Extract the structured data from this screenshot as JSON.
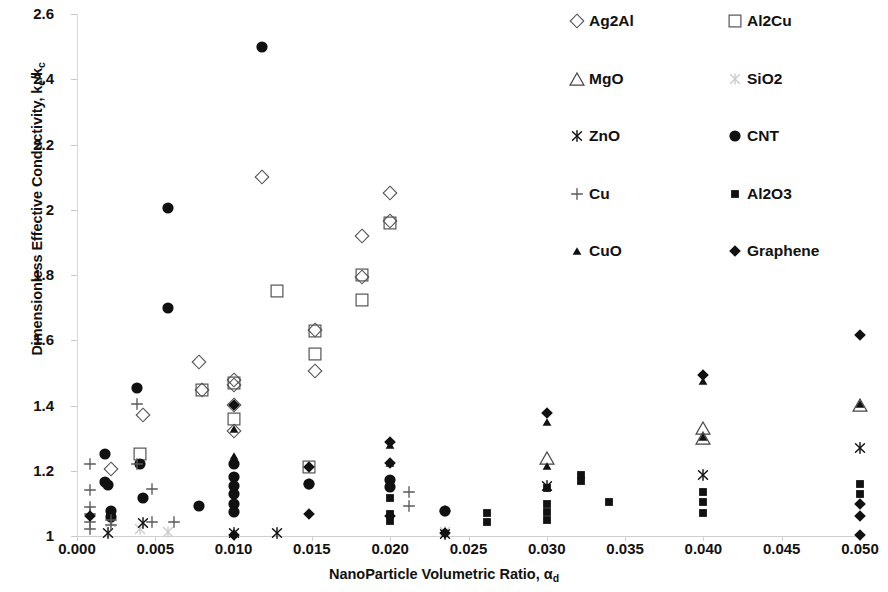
{
  "chart_data": {
    "type": "scatter",
    "title": "",
    "xlabel": "NanoParticle Volumetric Ratio, αd",
    "ylabel": "Dimensionless Effective Conductivity, ke/kc",
    "xlim": [
      0.0,
      0.05
    ],
    "ylim": [
      1.0,
      2.6
    ],
    "xticks": [
      "0.000",
      "0.005",
      "0.010",
      "0.015",
      "0.020",
      "0.025",
      "0.030",
      "0.035",
      "0.040",
      "0.045",
      "0.050"
    ],
    "xtick_values": [
      0.0,
      0.005,
      0.01,
      0.015,
      0.02,
      0.025,
      0.03,
      0.035,
      0.04,
      0.045,
      0.05
    ],
    "yticks": [
      "1",
      "1.2",
      "1.4",
      "1.6",
      "1.8",
      "2",
      "2.2",
      "2.4",
      "2.6"
    ],
    "ytick_values": [
      1,
      1.2,
      1.4,
      1.6,
      1.8,
      2,
      2.2,
      2.4,
      2.6
    ],
    "grid": false,
    "legend_position": "top-right",
    "marker_color": "#111111",
    "series": [
      {
        "name": "Ag2Al",
        "marker": "open-diamond",
        "points": [
          [
            0.0042,
            1.372
          ],
          [
            0.0078,
            1.532
          ],
          [
            0.008,
            1.448
          ],
          [
            0.01,
            1.478
          ],
          [
            0.01,
            1.462
          ],
          [
            0.01,
            1.402
          ],
          [
            0.01,
            1.322
          ],
          [
            0.0118,
            2.1
          ],
          [
            0.0152,
            1.632
          ],
          [
            0.0152,
            1.506
          ],
          [
            0.0182,
            1.92
          ],
          [
            0.0182,
            1.795
          ],
          [
            0.02,
            2.05
          ],
          [
            0.02,
            1.965
          ],
          [
            0.0022,
            1.205
          ]
        ]
      },
      {
        "name": "Al2Cu",
        "marker": "open-square",
        "points": [
          [
            0.004,
            1.25
          ],
          [
            0.008,
            1.448
          ],
          [
            0.01,
            1.47
          ],
          [
            0.01,
            1.36
          ],
          [
            0.0128,
            1.75
          ],
          [
            0.0152,
            1.628
          ],
          [
            0.0152,
            1.558
          ],
          [
            0.0182,
            1.8
          ],
          [
            0.0182,
            1.722
          ],
          [
            0.02,
            1.958
          ],
          [
            0.0148,
            1.212
          ]
        ]
      },
      {
        "name": "MgO",
        "marker": "open-triangle",
        "points": [
          [
            0.03,
            1.24
          ],
          [
            0.04,
            1.3
          ],
          [
            0.04,
            1.332
          ],
          [
            0.05,
            1.402
          ]
        ]
      },
      {
        "name": "SiO2",
        "marker": "light-x",
        "points": [
          [
            0.0022,
            1.042
          ],
          [
            0.004,
            1.022
          ],
          [
            0.0058,
            1.012
          ],
          [
            0.0235,
            1.012
          ]
        ]
      },
      {
        "name": "ZnO",
        "marker": "x-asterisk",
        "points": [
          [
            0.002,
            1.008
          ],
          [
            0.0042,
            1.04
          ],
          [
            0.01,
            1.008
          ],
          [
            0.0128,
            1.01
          ],
          [
            0.0235,
            1.005
          ],
          [
            0.03,
            1.152
          ],
          [
            0.04,
            1.188
          ],
          [
            0.05,
            1.27
          ]
        ]
      },
      {
        "name": "CNT",
        "marker": "filled-circle",
        "points": [
          [
            0.0018,
            1.25
          ],
          [
            0.0018,
            1.165
          ],
          [
            0.002,
            1.155
          ],
          [
            0.0022,
            1.078
          ],
          [
            0.0022,
            1.058
          ],
          [
            0.0038,
            1.455
          ],
          [
            0.004,
            1.222
          ],
          [
            0.0042,
            1.118
          ],
          [
            0.0058,
            2.005
          ],
          [
            0.0058,
            1.7
          ],
          [
            0.0078,
            1.092
          ],
          [
            0.01,
            1.222
          ],
          [
            0.01,
            1.182
          ],
          [
            0.01,
            1.152
          ],
          [
            0.01,
            1.128
          ],
          [
            0.01,
            1.098
          ],
          [
            0.01,
            1.075
          ],
          [
            0.0118,
            2.5
          ],
          [
            0.0148,
            1.158
          ],
          [
            0.02,
            1.172
          ],
          [
            0.02,
            1.15
          ],
          [
            0.0235,
            1.078
          ]
        ]
      },
      {
        "name": "Cu",
        "marker": "plus",
        "points": [
          [
            0.0008,
            1.222
          ],
          [
            0.0008,
            1.142
          ],
          [
            0.0008,
            1.088
          ],
          [
            0.0008,
            1.068
          ],
          [
            0.0008,
            1.042
          ],
          [
            0.0008,
            1.022
          ],
          [
            0.0022,
            1.05
          ],
          [
            0.0022,
            1.035
          ],
          [
            0.0038,
            1.405
          ],
          [
            0.0038,
            1.222
          ],
          [
            0.0048,
            1.145
          ],
          [
            0.0048,
            1.042
          ],
          [
            0.0062,
            1.042
          ],
          [
            0.0212,
            1.135
          ],
          [
            0.0212,
            1.092
          ]
        ]
      },
      {
        "name": "Al2O3",
        "marker": "filled-square",
        "points": [
          [
            0.02,
            1.155
          ],
          [
            0.02,
            1.115
          ],
          [
            0.02,
            1.068
          ],
          [
            0.02,
            1.045
          ],
          [
            0.0262,
            1.07
          ],
          [
            0.0262,
            1.042
          ],
          [
            0.03,
            1.148
          ],
          [
            0.03,
            1.098
          ],
          [
            0.03,
            1.075
          ],
          [
            0.03,
            1.048
          ],
          [
            0.0322,
            1.188
          ],
          [
            0.0322,
            1.168
          ],
          [
            0.034,
            1.105
          ],
          [
            0.04,
            1.135
          ],
          [
            0.04,
            1.105
          ],
          [
            0.04,
            1.072
          ],
          [
            0.05,
            1.158
          ],
          [
            0.05,
            1.13
          ]
        ]
      },
      {
        "name": "CuO",
        "marker": "small-filled-triangle",
        "points": [
          [
            0.01,
            1.245
          ],
          [
            0.01,
            1.328
          ],
          [
            0.02,
            1.278
          ],
          [
            0.02,
            1.225
          ],
          [
            0.03,
            1.215
          ],
          [
            0.03,
            1.348
          ],
          [
            0.04,
            1.302
          ],
          [
            0.04,
            1.475
          ],
          [
            0.05,
            1.405
          ]
        ]
      },
      {
        "name": "Graphene",
        "marker": "filled-diamond",
        "points": [
          [
            0.0008,
            1.062
          ],
          [
            0.01,
            1.402
          ],
          [
            0.0148,
            1.212
          ],
          [
            0.0148,
            1.158
          ],
          [
            0.0148,
            1.068
          ],
          [
            0.02,
            1.288
          ],
          [
            0.02,
            1.225
          ],
          [
            0.02,
            1.062
          ],
          [
            0.0235,
            1.078
          ],
          [
            0.0235,
            1.008
          ],
          [
            0.03,
            1.378
          ],
          [
            0.04,
            1.495
          ],
          [
            0.05,
            1.615
          ],
          [
            0.05,
            1.098
          ],
          [
            0.05,
            1.062
          ],
          [
            0.05,
            1.002
          ],
          [
            0.01,
            1.002
          ]
        ]
      }
    ]
  },
  "legend": {
    "rows": [
      [
        {
          "label": "Ag2Al",
          "marker": "open-diamond"
        },
        {
          "label": "Al2Cu",
          "marker": "open-square"
        }
      ],
      [
        {
          "label": "MgO",
          "marker": "open-triangle"
        },
        {
          "label": "SiO2",
          "marker": "light-x"
        }
      ],
      [
        {
          "label": "ZnO",
          "marker": "x-asterisk"
        },
        {
          "label": "CNT",
          "marker": "filled-circle"
        }
      ],
      [
        {
          "label": "Cu",
          "marker": "plus"
        },
        {
          "label": "Al2O3",
          "marker": "filled-square"
        }
      ],
      [
        {
          "label": "CuO",
          "marker": "small-filled-triangle"
        },
        {
          "label": "Graphene",
          "marker": "filled-diamond"
        }
      ]
    ]
  },
  "axis_titles": {
    "y_main": "Dimensionless Effective Conductivity, k",
    "y_sub1": "e",
    "y_mid": "/k",
    "y_sub2": "c",
    "x_main": "NanoParticle Volumetric Ratio, α",
    "x_sub": "d"
  }
}
